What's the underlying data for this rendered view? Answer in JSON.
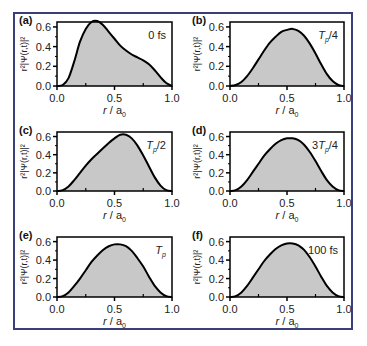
{
  "figure": {
    "frame_color": "#3a3f7a",
    "fill_color": "#c8c8c8",
    "line_color": "#000000"
  },
  "chart_data": [
    {
      "type": "area",
      "panel": "(a)",
      "annotation": "0 fs",
      "xlabel": "r / a0",
      "ylabel": "r²|Ψ(r,t)|²",
      "xlim": [
        0.0,
        1.0
      ],
      "ylim": [
        0.0,
        0.65
      ],
      "xticks": [
        "0.0",
        "0.5",
        "1.0"
      ],
      "yticks": [
        "0.0",
        "0.2",
        "0.4",
        "0.6"
      ],
      "x": [
        0.0,
        0.05,
        0.1,
        0.15,
        0.2,
        0.25,
        0.3,
        0.35,
        0.4,
        0.45,
        0.5,
        0.55,
        0.6,
        0.65,
        0.7,
        0.75,
        0.8,
        0.85,
        0.9,
        0.95,
        1.0
      ],
      "y": [
        0.0,
        0.01,
        0.08,
        0.25,
        0.45,
        0.58,
        0.65,
        0.66,
        0.62,
        0.55,
        0.48,
        0.41,
        0.36,
        0.32,
        0.29,
        0.26,
        0.22,
        0.16,
        0.09,
        0.03,
        0.0
      ]
    },
    {
      "type": "area",
      "panel": "(b)",
      "annotation": "Tp/4",
      "xlabel": "r / a0",
      "ylabel": "r²|Ψ(r,t)|²",
      "xlim": [
        0.0,
        1.0
      ],
      "ylim": [
        0.0,
        0.65
      ],
      "xticks": [
        "0.0",
        "0.5",
        "1.0"
      ],
      "yticks": [
        "0.0",
        "0.2",
        "0.4",
        "0.6"
      ],
      "x": [
        0.0,
        0.05,
        0.1,
        0.15,
        0.2,
        0.25,
        0.3,
        0.35,
        0.4,
        0.45,
        0.5,
        0.55,
        0.6,
        0.65,
        0.7,
        0.75,
        0.8,
        0.85,
        0.9,
        0.95,
        1.0
      ],
      "y": [
        0.0,
        0.01,
        0.04,
        0.1,
        0.18,
        0.27,
        0.36,
        0.44,
        0.5,
        0.55,
        0.57,
        0.58,
        0.56,
        0.51,
        0.43,
        0.33,
        0.22,
        0.12,
        0.05,
        0.01,
        0.0
      ]
    },
    {
      "type": "area",
      "panel": "(c)",
      "annotation": "Tp/2",
      "xlabel": "r / a0",
      "ylabel": "r²|Ψ(r,t)|²",
      "xlim": [
        0.0,
        1.0
      ],
      "ylim": [
        0.0,
        0.65
      ],
      "xticks": [
        "0.0",
        "0.5",
        "1.0"
      ],
      "yticks": [
        "0.0",
        "0.2",
        "0.4",
        "0.6"
      ],
      "x": [
        0.0,
        0.05,
        0.1,
        0.15,
        0.2,
        0.25,
        0.3,
        0.35,
        0.4,
        0.45,
        0.5,
        0.55,
        0.6,
        0.65,
        0.7,
        0.75,
        0.8,
        0.85,
        0.9,
        0.95,
        1.0
      ],
      "y": [
        0.0,
        0.01,
        0.05,
        0.12,
        0.2,
        0.28,
        0.35,
        0.41,
        0.47,
        0.53,
        0.58,
        0.62,
        0.62,
        0.58,
        0.5,
        0.39,
        0.27,
        0.15,
        0.06,
        0.01,
        0.0
      ]
    },
    {
      "type": "area",
      "panel": "(d)",
      "annotation": "3Tp/4",
      "xlabel": "r / a0",
      "ylabel": "r²|Ψ(r,t)|²",
      "xlim": [
        0.0,
        1.0
      ],
      "ylim": [
        0.0,
        0.65
      ],
      "xticks": [
        "0.0",
        "0.5",
        "1.0"
      ],
      "yticks": [
        "0.0",
        "0.2",
        "0.4",
        "0.6"
      ],
      "x": [
        0.0,
        0.05,
        0.1,
        0.15,
        0.2,
        0.25,
        0.3,
        0.35,
        0.4,
        0.45,
        0.5,
        0.55,
        0.6,
        0.65,
        0.7,
        0.75,
        0.8,
        0.85,
        0.9,
        0.95,
        1.0
      ],
      "y": [
        0.0,
        0.01,
        0.05,
        0.12,
        0.21,
        0.3,
        0.39,
        0.46,
        0.52,
        0.56,
        0.58,
        0.58,
        0.56,
        0.51,
        0.43,
        0.33,
        0.22,
        0.12,
        0.05,
        0.01,
        0.0
      ]
    },
    {
      "type": "area",
      "panel": "(e)",
      "annotation": "Tp",
      "xlabel": "r / a0",
      "ylabel": "r²|Ψ(r,t)|²",
      "xlim": [
        0.0,
        1.0
      ],
      "ylim": [
        0.0,
        0.65
      ],
      "xticks": [
        "0.0",
        "0.5",
        "1.0"
      ],
      "yticks": [
        "0.0",
        "0.2",
        "0.4",
        "0.6"
      ],
      "x": [
        0.0,
        0.05,
        0.1,
        0.15,
        0.2,
        0.25,
        0.3,
        0.35,
        0.4,
        0.45,
        0.5,
        0.55,
        0.6,
        0.65,
        0.7,
        0.75,
        0.8,
        0.85,
        0.9,
        0.95,
        1.0
      ],
      "y": [
        0.0,
        0.01,
        0.05,
        0.12,
        0.2,
        0.29,
        0.38,
        0.45,
        0.51,
        0.55,
        0.57,
        0.57,
        0.55,
        0.5,
        0.42,
        0.33,
        0.22,
        0.12,
        0.05,
        0.01,
        0.0
      ]
    },
    {
      "type": "area",
      "panel": "(f)",
      "annotation": "100 fs",
      "xlabel": "r / a0",
      "ylabel": "r²|Ψ(r,t)|²",
      "xlim": [
        0.0,
        1.0
      ],
      "ylim": [
        0.0,
        0.65
      ],
      "xticks": [
        "0.0",
        "0.5",
        "1.0"
      ],
      "yticks": [
        "0.0",
        "0.2",
        "0.4",
        "0.6"
      ],
      "x": [
        0.0,
        0.05,
        0.1,
        0.15,
        0.2,
        0.25,
        0.3,
        0.35,
        0.4,
        0.45,
        0.5,
        0.55,
        0.6,
        0.65,
        0.7,
        0.75,
        0.8,
        0.85,
        0.9,
        0.95,
        1.0
      ],
      "y": [
        0.0,
        0.01,
        0.05,
        0.12,
        0.21,
        0.3,
        0.39,
        0.46,
        0.52,
        0.56,
        0.58,
        0.58,
        0.56,
        0.51,
        0.43,
        0.33,
        0.22,
        0.12,
        0.05,
        0.01,
        0.0
      ]
    }
  ]
}
